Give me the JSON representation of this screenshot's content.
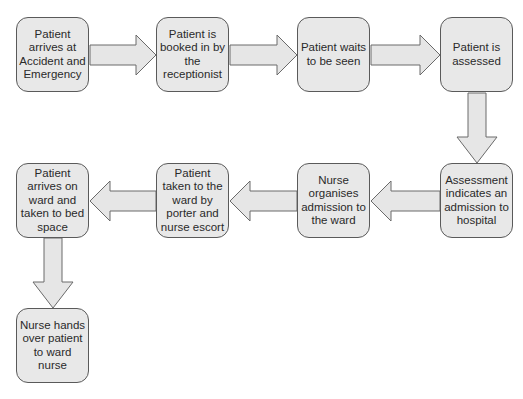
{
  "diagram": {
    "type": "flowchart",
    "colors": {
      "box_fill": "#e8e8e8",
      "box_border": "#5a5a5a",
      "arrow_fill": "#e6e6e6",
      "arrow_stroke": "#6a6a6a",
      "text": "#2a2a2a",
      "background": "#ffffff"
    },
    "steps": [
      {
        "id": 1,
        "label": "Patient arrives at Accident and Emergency"
      },
      {
        "id": 2,
        "label": "Patient is booked in by the receptionist"
      },
      {
        "id": 3,
        "label": "Patient waits to be seen"
      },
      {
        "id": 4,
        "label": "Patient is assessed"
      },
      {
        "id": 5,
        "label": "Assessment indicates an admission to hospital"
      },
      {
        "id": 6,
        "label": "Nurse organises admission to the ward"
      },
      {
        "id": 7,
        "label": "Patient taken to the ward by porter and nurse escort"
      },
      {
        "id": 8,
        "label": "Patient arrives on ward and taken to bed space"
      },
      {
        "id": 9,
        "label": "Nurse hands over patient to ward nurse"
      }
    ],
    "connections": [
      {
        "from": 1,
        "to": 2,
        "direction": "right"
      },
      {
        "from": 2,
        "to": 3,
        "direction": "right"
      },
      {
        "from": 3,
        "to": 4,
        "direction": "right"
      },
      {
        "from": 4,
        "to": 5,
        "direction": "down"
      },
      {
        "from": 5,
        "to": 6,
        "direction": "left"
      },
      {
        "from": 6,
        "to": 7,
        "direction": "left"
      },
      {
        "from": 7,
        "to": 8,
        "direction": "left"
      },
      {
        "from": 8,
        "to": 9,
        "direction": "down"
      }
    ]
  }
}
